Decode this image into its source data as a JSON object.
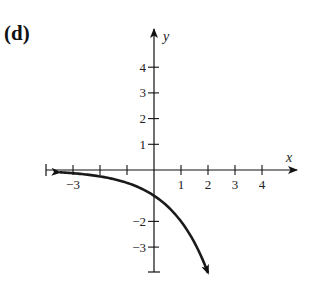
{
  "panel_label": "(d)",
  "axes": {
    "x_label": "x",
    "y_label": "y",
    "x_ticks": [
      {
        "value": -4,
        "label": ""
      },
      {
        "value": -3,
        "label": "−3"
      },
      {
        "value": -2,
        "label": ""
      },
      {
        "value": -1,
        "label": ""
      },
      {
        "value": 1,
        "label": "1"
      },
      {
        "value": 2,
        "label": "2"
      },
      {
        "value": 3,
        "label": "3"
      },
      {
        "value": 4,
        "label": "4"
      }
    ],
    "y_ticks": [
      {
        "value": 4,
        "label": "4"
      },
      {
        "value": 3,
        "label": "3"
      },
      {
        "value": 2,
        "label": "2"
      },
      {
        "value": 1,
        "label": "1"
      },
      {
        "value": -2,
        "label": "−2"
      },
      {
        "value": -3,
        "label": "−3"
      },
      {
        "value": -4,
        "label": ""
      }
    ],
    "xlim": [
      -4,
      5
    ],
    "ylim": [
      -4.5,
      4.8
    ]
  },
  "curve": {
    "description": "Decreasing exponential curve y = -2^x, horizontal asymptote y = 0 on the left, passing through (0, -1) and heading downward past (2, -4)",
    "x_start": -3.5,
    "x_end": 2.0,
    "color": "#1a1a1a"
  },
  "chart_data": {
    "type": "line",
    "title": "(d)",
    "xlabel": "x",
    "ylabel": "y",
    "x": [
      -3.5,
      -3,
      -2,
      -1,
      0,
      1,
      1.5,
      2
    ],
    "series": [
      {
        "name": "y = -2^x",
        "values": [
          -0.09,
          -0.125,
          -0.25,
          -0.5,
          -1,
          -2,
          -2.83,
          -4
        ]
      }
    ],
    "xlim": [
      -4,
      5
    ],
    "ylim": [
      -4.5,
      4.8
    ],
    "x_tick_labels": [
      "−3",
      "1",
      "2",
      "3",
      "4"
    ],
    "y_tick_labels": [
      "4",
      "3",
      "2",
      "1",
      "−2",
      "−3"
    ],
    "grid": false,
    "legend": "none",
    "annotations": [
      "arrow at left end of curve",
      "arrow at lower end of curve"
    ]
  }
}
